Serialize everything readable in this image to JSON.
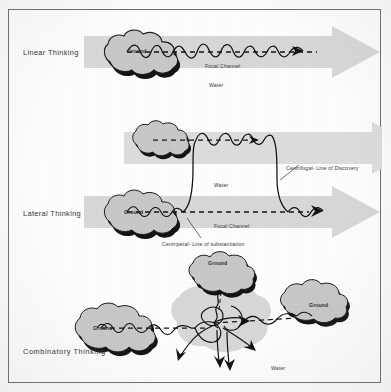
{
  "figure": {
    "background_color": "#ffffff",
    "border_color": "#6e6e78",
    "arrow_fill": "#d9d9d9",
    "arrow_fill_light": "#dedede",
    "ground_fill": "#c9c9c9",
    "ground_shadow": "#101010",
    "water_fill": "#d9d9d9",
    "stream_color": "#111111"
  },
  "panels": [
    {
      "id": "linear",
      "label": "Linear Thinking",
      "ground_labels": [
        "Ground"
      ],
      "annotations": [
        "Focal Channel",
        "Water"
      ],
      "arrows": 1,
      "description": "One island at left feeding a single wavy stream that runs straight through a single rightward arrow along one dashed focal channel."
    },
    {
      "id": "lateral",
      "label": "Lateral Thinking",
      "ground_labels": [
        "Ground"
      ],
      "annotations": [
        "Water",
        "Focal Channel",
        "Centrifugal- Line of Discovery",
        "Centripetal- Line of substantiation"
      ],
      "arrows": 2,
      "description": "Two stacked rightward arrows; a stream departs the lower focal channel, arcs up into the upper arrow and returns down again to the lower channel."
    },
    {
      "id": "combinatory",
      "label": "Combinatory Thinking",
      "ground_labels": [
        "Ground",
        "Ground",
        "Ground"
      ],
      "annotations": [
        "Water"
      ],
      "arrows": 0,
      "description": "Three islands - left, top and right - all feeding streams into a central irregular water pool from which many arrowed streams radiate outward."
    }
  ],
  "labels": {
    "ground": "Ground",
    "water": "Water",
    "focal_channel": "Focal Channel",
    "centrifugal": "Centrifugal- Line of Discovery",
    "centripetal": "Centripetal- Line of substantiation"
  }
}
